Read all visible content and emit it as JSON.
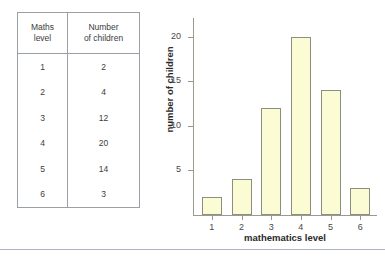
{
  "table": {
    "headers": [
      "Maths level",
      "Number of children"
    ],
    "header_lines": [
      [
        "Maths",
        "level"
      ],
      [
        "Number",
        "of children"
      ]
    ],
    "rows": [
      {
        "level": "1",
        "children": "2"
      },
      {
        "level": "2",
        "children": "4"
      },
      {
        "level": "3",
        "children": "12"
      },
      {
        "level": "4",
        "children": "20"
      },
      {
        "level": "5",
        "children": "14"
      },
      {
        "level": "6",
        "children": "3"
      }
    ]
  },
  "chart_data": {
    "type": "bar",
    "title": "",
    "xlabel": "mathematics level",
    "ylabel": "number of children",
    "categories": [
      "1",
      "2",
      "3",
      "4",
      "5",
      "6"
    ],
    "values": [
      2,
      4,
      12,
      20,
      14,
      3
    ],
    "yticks": [
      "5",
      "10",
      "15",
      "20"
    ],
    "ytick_values": [
      5,
      10,
      15,
      20
    ],
    "ylim": [
      0,
      22
    ],
    "grid": false,
    "legend": null,
    "bar_fill": "#fbfbd4",
    "bar_border": "#8e8e80",
    "axis_color": "#9a9a90"
  },
  "colors": {
    "background": "#ffffff",
    "table_border": "#9aa0a6",
    "text": "#3c3c3c",
    "footer_rule": "#aeb4c4"
  }
}
